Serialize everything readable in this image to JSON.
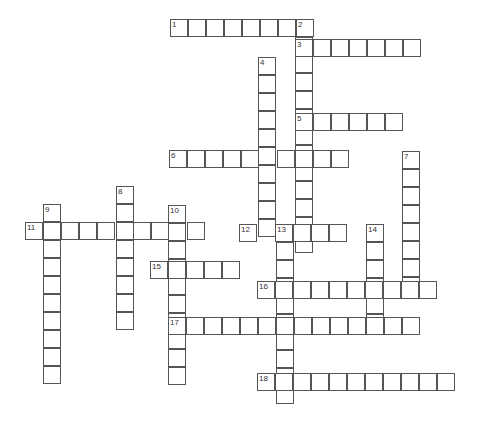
{
  "puzzle": {
    "type": "crossword",
    "cell_size": 18,
    "colors": {
      "background": "#ffffff",
      "grid_line": "#555555",
      "number_text": "#333333"
    },
    "words": [
      {
        "number": "1",
        "direction": "across",
        "x": 170,
        "y": 19,
        "length": 8
      },
      {
        "number": "2",
        "direction": "down",
        "x": 295,
        "y": 19,
        "length": 13
      },
      {
        "number": "3",
        "direction": "across",
        "x": 295,
        "y": 39,
        "length": 7
      },
      {
        "number": "4",
        "direction": "down",
        "x": 258,
        "y": 57,
        "length": 10
      },
      {
        "number": "5",
        "direction": "across",
        "x": 295,
        "y": 113,
        "length": 6
      },
      {
        "number": "6",
        "direction": "across",
        "x": 169,
        "y": 150,
        "length": 10
      },
      {
        "number": "7",
        "direction": "down",
        "x": 402,
        "y": 151,
        "length": 8
      },
      {
        "number": "8",
        "direction": "down",
        "x": 116,
        "y": 186,
        "length": 8
      },
      {
        "number": "9",
        "direction": "down",
        "x": 43,
        "y": 204,
        "length": 10
      },
      {
        "number": "10",
        "direction": "down",
        "x": 168,
        "y": 205,
        "length": 10
      },
      {
        "number": "11",
        "direction": "across",
        "x": 25,
        "y": 222,
        "length": 10
      },
      {
        "number": "12",
        "direction": "across",
        "x": 239,
        "y": 224,
        "length": 6
      },
      {
        "number": "13",
        "direction": "down",
        "x": 276,
        "y": 224,
        "length": 10
      },
      {
        "number": "14",
        "direction": "down",
        "x": 366,
        "y": 224,
        "length": 6
      },
      {
        "number": "15",
        "direction": "across",
        "x": 150,
        "y": 261,
        "length": 5
      },
      {
        "number": "16",
        "direction": "across",
        "x": 257,
        "y": 281,
        "length": 10
      },
      {
        "number": "17",
        "direction": "across",
        "x": 168,
        "y": 317,
        "length": 14
      },
      {
        "number": "18",
        "direction": "across",
        "x": 257,
        "y": 373,
        "length": 11
      }
    ]
  }
}
